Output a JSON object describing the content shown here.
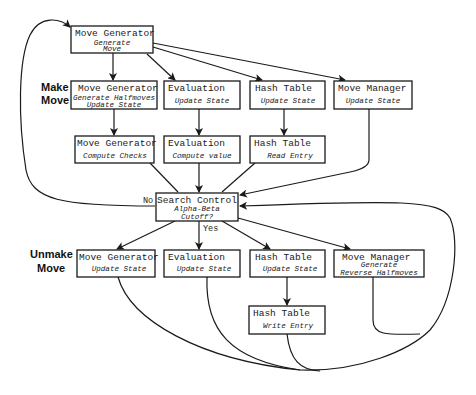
{
  "diagram": {
    "section_labels": {
      "make_move": [
        "Make",
        "Move"
      ],
      "unmake_move": [
        "Unmake",
        "Move"
      ]
    },
    "nodes": {
      "top_move_generator": {
        "title": "Move Generator",
        "lines": [
          "Generate",
          "Move"
        ]
      },
      "make_move_generator": {
        "title": "Move Generator",
        "lines": [
          "Generate Halfmoves",
          "Update State"
        ]
      },
      "make_evaluation": {
        "title": "Evaluation",
        "lines": [
          "Update State"
        ]
      },
      "make_hash_table": {
        "title": "Hash Table",
        "lines": [
          "Update State"
        ]
      },
      "make_move_manager": {
        "title": "Move Manager",
        "lines": [
          "Update State"
        ]
      },
      "checks_move_generator": {
        "title": "Move Generator",
        "lines": [
          "Compute Checks"
        ]
      },
      "compute_evaluation": {
        "title": "Evaluation",
        "lines": [
          "Compute value"
        ]
      },
      "read_hash_table": {
        "title": "Hash Table",
        "lines": [
          "Read Entry"
        ]
      },
      "search_control": {
        "title": "Search Control",
        "lines": [
          "Alpha-Beta",
          "Cutoff?"
        ]
      },
      "unmake_move_generator": {
        "title": "Move Generator",
        "lines": [
          "Update State"
        ]
      },
      "unmake_evaluation": {
        "title": "Evaluation",
        "lines": [
          "Update State"
        ]
      },
      "unmake_hash_table": {
        "title": "Hash Table",
        "lines": [
          "Update State"
        ]
      },
      "unmake_move_manager": {
        "title": "Move Manager",
        "lines": [
          "Generate",
          "Reverse Halfmoves"
        ]
      },
      "write_hash_table": {
        "title": "Hash Table",
        "lines": [
          "Write Entry"
        ]
      }
    },
    "edge_labels": {
      "no": "No",
      "yes": "Yes"
    },
    "colors": {
      "stroke": "#1a1a1a",
      "background": "#ffffff"
    }
  }
}
